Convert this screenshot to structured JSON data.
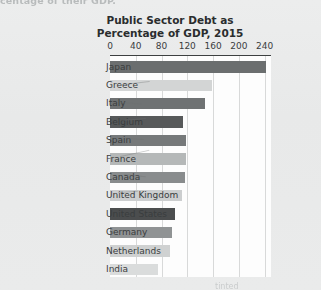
{
  "page": {
    "clipped_text_top": "centage of their GDP.",
    "bottom_smudge": "tinted"
  },
  "chart_data": {
    "type": "bar",
    "orientation": "horizontal",
    "title": "Public Sector Debt as Percentage of GDP, 2015",
    "title_line1": "Public Sector Debt as",
    "title_line2": "Percentage of GDP, 2015",
    "xlabel": "",
    "ylabel": "",
    "xlim": [
      0,
      250
    ],
    "xticks": [
      0,
      40,
      80,
      120,
      160,
      200,
      240
    ],
    "xtick_labels": [
      "0",
      "40",
      "80",
      "120",
      "160",
      "200",
      "240"
    ],
    "grid": true,
    "grid_axis": "x",
    "legend": "none",
    "categories": [
      "Japan",
      "Greece",
      "Italy",
      "Belgium",
      "Spain",
      "France",
      "Canada",
      "United Kingdom",
      "United States",
      "Germany",
      "Netherlands",
      "India"
    ],
    "values": [
      242,
      158,
      148,
      113,
      118,
      118,
      117,
      112,
      101,
      97,
      93,
      75
    ],
    "bar_colors": [
      "#6b6e6f",
      "#d3d5d5",
      "#6f7273",
      "#57595a",
      "#76797a",
      "#b5b8b8",
      "#898c8d",
      "#cccecf",
      "#4b4d4e",
      "#909394",
      "#cfd1d1",
      "#dadcdc"
    ],
    "points": [
      {
        "category": "Japan",
        "value": 242,
        "color": "#6b6e6f"
      },
      {
        "category": "Greece",
        "value": 158,
        "color": "#d3d5d5"
      },
      {
        "category": "Italy",
        "value": 148,
        "color": "#6f7273"
      },
      {
        "category": "Belgium",
        "value": 113,
        "color": "#57595a"
      },
      {
        "category": "Spain",
        "value": 118,
        "color": "#76797a"
      },
      {
        "category": "France",
        "value": 118,
        "color": "#b5b8b8"
      },
      {
        "category": "Canada",
        "value": 117,
        "color": "#898c8d"
      },
      {
        "category": "United Kingdom",
        "value": 112,
        "color": "#cccecf"
      },
      {
        "category": "United States",
        "value": 101,
        "color": "#4b4d4e"
      },
      {
        "category": "Germany",
        "value": 97,
        "color": "#909394"
      },
      {
        "category": "Netherlands",
        "value": 93,
        "color": "#cfd1d1"
      },
      {
        "category": "India",
        "value": 75,
        "color": "#dadcdc"
      }
    ]
  },
  "colors": {
    "plot_background": "#fdfdfd",
    "page_background": "#e9eaea",
    "gridline": "#d8d9d9",
    "axis": "#3d4041",
    "text": "#2a2d2e"
  }
}
